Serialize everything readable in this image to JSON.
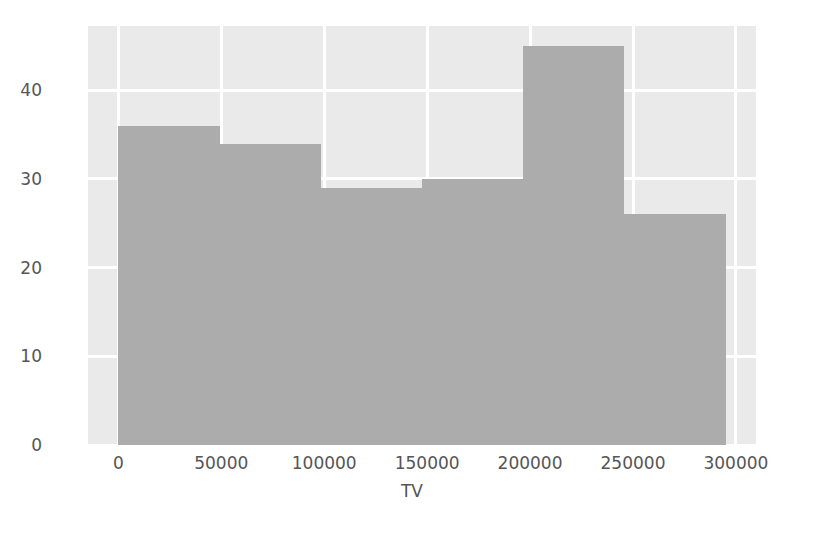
{
  "figure": {
    "background_color": "#ffffff",
    "plot_background_color": "#eaeaea",
    "grid_color": "#ffffff",
    "bar_color": "#acacac",
    "tick_label_color": "#555555"
  },
  "chart_data": {
    "type": "bar",
    "subtype": "histogram",
    "title": "",
    "xlabel": "TV",
    "ylabel": "",
    "categories": [
      "0-49167",
      "49167-98333",
      "98333-147500",
      "147500-196667",
      "196667-245833",
      "245833-295000"
    ],
    "bin_edges": [
      0,
      49167,
      98333,
      147500,
      196667,
      245833,
      295000
    ],
    "values": [
      36,
      34,
      29,
      30,
      45,
      26
    ],
    "x": [
      24583,
      73750,
      122917,
      172083,
      221250,
      270417
    ],
    "xlim": [
      -14750,
      309750
    ],
    "ylim": [
      0,
      47.25
    ],
    "xticks": [
      0,
      50000,
      100000,
      150000,
      200000,
      250000,
      300000
    ],
    "xtick_labels": [
      "0",
      "50000",
      "100000",
      "150000",
      "200000",
      "250000",
      "300000"
    ],
    "yticks": [
      0,
      10,
      20,
      30,
      40
    ],
    "ytick_labels": [
      "0",
      "10",
      "20",
      "30",
      "40"
    ],
    "grid": true,
    "legend": null,
    "legend_position": "none",
    "series": [
      {
        "name": "TV",
        "values": [
          36,
          34,
          29,
          30,
          45,
          26
        ]
      }
    ]
  }
}
